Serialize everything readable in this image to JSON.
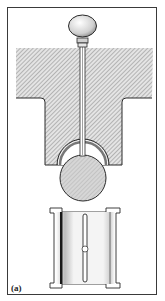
{
  "figure": {
    "label": "(a)",
    "colors": {
      "outline": "#2a2a2a",
      "hatch": "#9a9a9a",
      "fill_light": "#d8d8d8",
      "background": "#ffffff"
    },
    "parts": {
      "knob": "knob",
      "rod": "push-rod",
      "housing": "hatched-housing",
      "ball": "ball",
      "socket": "socket-liner",
      "sleeve": "split-sleeve-bearing"
    }
  }
}
